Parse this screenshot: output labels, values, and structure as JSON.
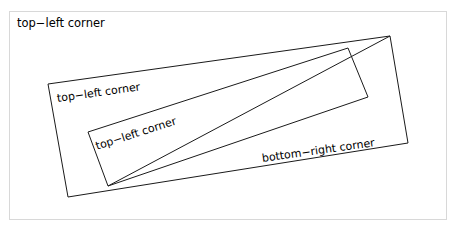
{
  "figure": {
    "background_color": "#ffffff",
    "frame_border_color": "#d8d8d8",
    "stroke_color": "#1a1a1a",
    "frame": {
      "x": 9,
      "y": 11,
      "width": 438,
      "height": 209
    },
    "labels": {
      "outer_title": "top−left corner",
      "outer_rect": "top−left corner",
      "inner_rect": "top−left corner",
      "bottom_right": "bottom−right corner"
    },
    "shapes": {
      "outer_rectangle": {
        "name": "outer-rotated-rectangle",
        "rotation_deg": -8.0,
        "points": "48,84 390,36 408,143 68,197"
      },
      "inner_rectangle": {
        "name": "inner-rotated-rectangle",
        "rotation_deg": -17.9,
        "points": "88,132 348,48 368,97 108,186"
      },
      "diagonal_line": {
        "name": "corner-connector-line",
        "x1": 108,
        "y1": 186,
        "x2": 390,
        "y2": 36
      }
    }
  }
}
